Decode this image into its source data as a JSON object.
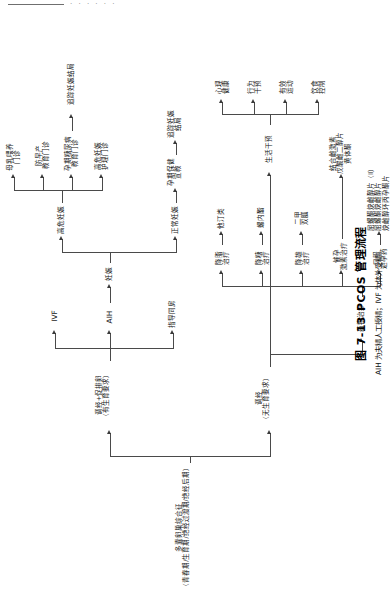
{
  "figure": {
    "caption_number": "图 7-13",
    "caption_title": "PCOS 管理流程",
    "caption_note": "AIH 为夫精人工授精；IVF 为体外受精。"
  },
  "nodes": {
    "root": "多囊卵巢综合征\n（青春期/生育期/绝经过渡期/绝经后期）",
    "fertility_branch": "调经+促排卵\n（有生育要求）",
    "no_fertility_branch": "调经\n（无生育要求）",
    "guided_intercourse": "指导同房",
    "aih": "AIH",
    "ivf": "IVF",
    "pregnancy": "妊娠",
    "normal_pregnancy": "正常妊娠",
    "prenatal_education": "孕期保健\n宣教",
    "track_outcome_normal": "追踪妊娠\n结局",
    "high_risk_pregnancy": "高危妊娠",
    "hr_nursing_clinic": "高危妊娠\n护理门诊",
    "gdm_education_clinic": "孕期糖尿病\n教育门诊",
    "preterm_education_clinic": "防早产\n教育门诊",
    "breastfeeding_clinic": "母乳喂养\n门诊",
    "track_outcome_highrisk": "追踪妊娠结局",
    "drug_therapy": "药物治疗",
    "oral_contraceptive": "口服\n避孕药",
    "progestin_therapy": "催孕\n激素治疗",
    "antidiabetic_therapy": "降糖\n治疗",
    "antiandrogen_therapy": "降雄\n治疗",
    "lipid_therapy": "降脂\n治疗",
    "oc_drugs": "屈螺酮炔雌醇片（Ⅱ）\n屈螺酮炔雌醇片\n炔雌醇环丙孕酮片",
    "progestin_drugs": "结合雌激素\n戊酸雌二醇片\n黄体酮",
    "metformin": "二甲\n双胍",
    "spironolactone": "螺内酯",
    "statins": "他汀类",
    "lifestyle_intervention": "生活干预",
    "diet_control": "饮食\n控制",
    "effective_exercise": "有效\n运动",
    "behavior_intervention": "行为\n干预",
    "psych_health": "心理\n健康"
  },
  "header": {
    "rule_dots": "· · · · · ·"
  }
}
